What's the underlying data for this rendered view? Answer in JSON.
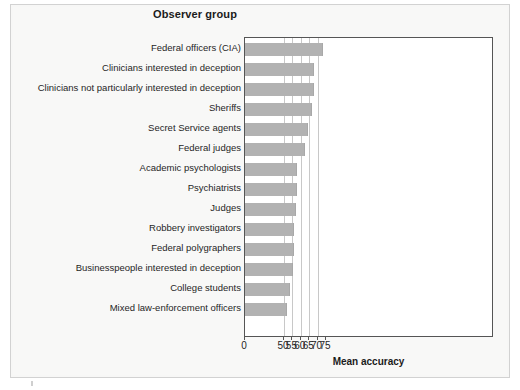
{
  "figure": {
    "title": "Observer group",
    "x_axis_title": "Mean accuracy"
  },
  "chart_data": {
    "type": "bar",
    "orientation": "horizontal",
    "title": "Observer group",
    "xlabel": "Mean accuracy",
    "ylabel": "Observer group",
    "xlim": [
      0,
      75
    ],
    "axis_break": true,
    "axis_break_note": "x-axis jumps from 0 directly to 50",
    "grid": true,
    "grid_axis": "x",
    "legend": null,
    "bar_color": "#b2b2b2",
    "tick_labels": [
      "0",
      "50",
      "55",
      "60",
      "65",
      "70",
      "75"
    ],
    "tick_values": [
      0,
      50,
      55,
      60,
      65,
      70,
      75
    ],
    "categories": [
      "Federal officers (CIA)",
      "Clinicians interested in deception",
      "Clinicians not particularly interested in deception",
      "Sheriffs",
      "Secret Service agents",
      "Federal judges",
      "Academic psychologists",
      "Psychiatrists",
      "Judges",
      "Robbery investigators",
      "Federal polygraphers",
      "Businesspeople interested in deception",
      "College students",
      "Mixed law-enforcement officers"
    ],
    "values": [
      73.0,
      67.9,
      67.8,
      66.9,
      64.4,
      62.3,
      57.9,
      57.7,
      57.0,
      55.8,
      55.8,
      55.5,
      53.3,
      51.5
    ]
  }
}
